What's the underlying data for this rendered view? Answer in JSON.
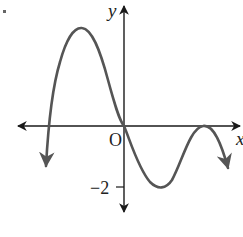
{
  "diagram": {
    "type": "function-graph",
    "axes": {
      "x_label": "x",
      "y_label": "y",
      "origin_label": "O",
      "y_tick_label": "−2"
    },
    "colors": {
      "axes": "#1a1a1a",
      "curve": "#555555"
    },
    "curve": {
      "description": "Polynomial curve: arrow down at far left, crosses x-axis left of origin, local maximum in quadrant II, passes through origin, local minimum at y = -2, touches x-axis tangentially at positive x, then arrows downward",
      "key_points": [
        {
          "name": "left-end",
          "x": "-inf",
          "y": "-inf"
        },
        {
          "name": "x-intercept-left",
          "y": 0
        },
        {
          "name": "local-max",
          "quadrant": "II"
        },
        {
          "name": "origin",
          "x": 0,
          "y": 0
        },
        {
          "name": "local-min",
          "y": -2
        },
        {
          "name": "tangent-x-intercept",
          "y": 0
        },
        {
          "name": "right-end",
          "x": "+inf",
          "y": "-inf"
        }
      ]
    },
    "marker": "bullet-dot"
  }
}
